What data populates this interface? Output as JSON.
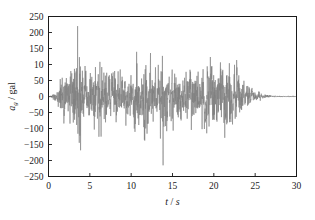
{
  "chart_data": {
    "type": "line",
    "title": "",
    "xlabel": "t / s",
    "ylabel": "a_g / gal",
    "ylabel_parts": {
      "symbol": "a",
      "subscript": "g",
      "separator": " / ",
      "unit": "gal"
    },
    "xlabel_parts": {
      "symbol": "t",
      "separator": " / ",
      "unit": "s"
    },
    "xlim": [
      0,
      30
    ],
    "ylim": [
      -250,
      250
    ],
    "xticks": [
      0,
      5,
      10,
      15,
      20,
      25,
      30
    ],
    "xtick_labels": [
      "0",
      "5",
      "10",
      "15",
      "20",
      "25",
      "30"
    ],
    "yticks": [
      250,
      200,
      150,
      100,
      50,
      0,
      -50,
      -100,
      -150,
      -200,
      -250
    ],
    "ytick_labels": [
      "250",
      "200",
      "150",
      "10",
      "50",
      "0",
      "−50",
      "−100",
      "−150",
      "−200",
      "−250"
    ],
    "grid": false,
    "legend": null,
    "line_color": "#808080",
    "frame_color": "#1a1a1a",
    "background": "#ffffff",
    "series": [
      {
        "name": "ground acceleration",
        "units": "gal",
        "sampling_interval_s": 0.02,
        "peak_positive": 220,
        "peak_positive_time": 3.52,
        "peak_negative": -215,
        "peak_negative_time": 13.86,
        "duration_s": 30,
        "envelope_description": "near-zero 0-0.8 s; rapid build-up 0.8-2 s; strong shaking plateau 2-24 s with amplitudes mostly 50-150 gal and isolated spikes to 220 gal; sharp decay 24-26.5 s; essentially flat residual after 26.5 s",
        "envelope_control_points": [
          {
            "t": 0.0,
            "amp": 2
          },
          {
            "t": 0.5,
            "amp": 14
          },
          {
            "t": 0.9,
            "amp": 26
          },
          {
            "t": 1.4,
            "amp": 70
          },
          {
            "t": 1.9,
            "amp": 128
          },
          {
            "t": 2.4,
            "amp": 118
          },
          {
            "t": 3.0,
            "amp": 140
          },
          {
            "t": 3.5,
            "amp": 218
          },
          {
            "t": 4.2,
            "amp": 132
          },
          {
            "t": 5.0,
            "amp": 150
          },
          {
            "t": 5.8,
            "amp": 120
          },
          {
            "t": 6.6,
            "amp": 146
          },
          {
            "t": 7.4,
            "amp": 132
          },
          {
            "t": 8.2,
            "amp": 112
          },
          {
            "t": 9.0,
            "amp": 130
          },
          {
            "t": 9.8,
            "amp": 120
          },
          {
            "t": 10.4,
            "amp": 196
          },
          {
            "t": 11.2,
            "amp": 140
          },
          {
            "t": 11.7,
            "amp": 198
          },
          {
            "t": 12.4,
            "amp": 130
          },
          {
            "t": 13.1,
            "amp": 140
          },
          {
            "t": 13.8,
            "amp": 220
          },
          {
            "t": 14.6,
            "amp": 138
          },
          {
            "t": 15.4,
            "amp": 124
          },
          {
            "t": 16.2,
            "amp": 134
          },
          {
            "t": 17.0,
            "amp": 120
          },
          {
            "t": 17.8,
            "amp": 128
          },
          {
            "t": 18.6,
            "amp": 140
          },
          {
            "t": 19.4,
            "amp": 160
          },
          {
            "t": 20.2,
            "amp": 130
          },
          {
            "t": 20.8,
            "amp": 196
          },
          {
            "t": 21.6,
            "amp": 198
          },
          {
            "t": 22.3,
            "amp": 150
          },
          {
            "t": 23.0,
            "amp": 120
          },
          {
            "t": 23.6,
            "amp": 96
          },
          {
            "t": 24.2,
            "amp": 60
          },
          {
            "t": 24.8,
            "amp": 34
          },
          {
            "t": 25.4,
            "amp": 20
          },
          {
            "t": 26.0,
            "amp": 12
          },
          {
            "t": 26.8,
            "amp": 6
          },
          {
            "t": 27.6,
            "amp": 4
          },
          {
            "t": 28.5,
            "amp": 3
          },
          {
            "t": 29.3,
            "amp": 3
          },
          {
            "t": 30.0,
            "amp": 3
          }
        ]
      }
    ]
  }
}
